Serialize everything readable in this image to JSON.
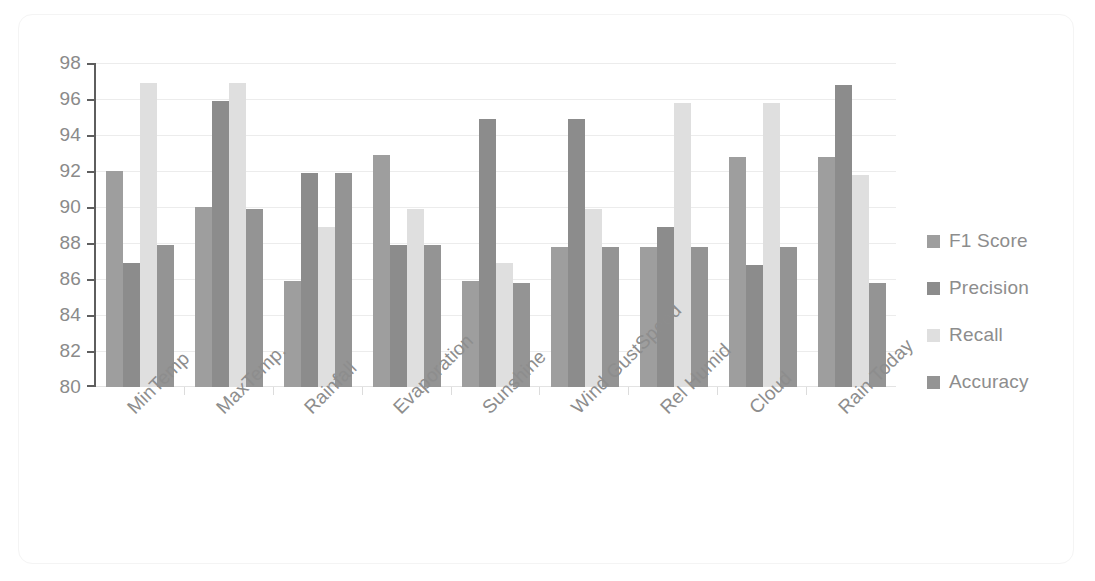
{
  "chart_data": {
    "type": "bar",
    "title": "",
    "subtitle": "",
    "xlabel": "",
    "ylabel": "",
    "ylim": [
      80,
      98
    ],
    "y_ticks": [
      98,
      96,
      94,
      92,
      90,
      88,
      86,
      84,
      82,
      80
    ],
    "grid": true,
    "legend_position": "right",
    "categories": [
      "MinTemp",
      "MaxTemp.",
      "Rainfall",
      "Evaporation",
      "Sunshine",
      "Wind GustSpeed",
      "Rel Humid",
      "Cloud",
      "Rain Today"
    ],
    "series": [
      {
        "name": "F1 Score",
        "color": "#9e9e9e",
        "values": [
          92.0,
          90.0,
          85.9,
          92.9,
          85.9,
          87.8,
          87.8,
          92.8,
          92.8
        ]
      },
      {
        "name": "Precision",
        "color": "#8c8c8c",
        "values": [
          86.9,
          95.9,
          91.9,
          87.9,
          94.9,
          94.9,
          88.9,
          86.8,
          96.8
        ]
      },
      {
        "name": "Recall",
        "color": "#dfdfdf",
        "values": [
          96.9,
          96.9,
          88.9,
          89.9,
          86.9,
          89.9,
          95.8,
          95.8,
          91.8
        ]
      },
      {
        "name": "Accuracy",
        "color": "#949494",
        "values": [
          87.9,
          89.9,
          91.9,
          87.9,
          85.8,
          87.8,
          87.8,
          87.8,
          85.8
        ]
      }
    ]
  }
}
